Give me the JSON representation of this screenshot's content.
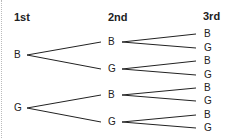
{
  "headers": [
    "1st",
    "2nd",
    "3rd"
  ],
  "tree": {
    "level1": [
      {
        "label": "B",
        "x": 14,
        "y": 55
      },
      {
        "label": "G",
        "x": 14,
        "y": 108
      }
    ],
    "level2": [
      {
        "label": "B",
        "x": 108,
        "y": 42
      },
      {
        "label": "G",
        "x": 108,
        "y": 69
      },
      {
        "label": "B",
        "x": 108,
        "y": 95
      },
      {
        "label": "G",
        "x": 108,
        "y": 122
      }
    ],
    "level3": [
      {
        "label": "B",
        "x": 204,
        "y": 34
      },
      {
        "label": "G",
        "x": 204,
        "y": 48
      },
      {
        "label": "B",
        "x": 204,
        "y": 61
      },
      {
        "label": "G",
        "x": 204,
        "y": 75
      },
      {
        "label": "B",
        "x": 204,
        "y": 88
      },
      {
        "label": "G",
        "x": 204,
        "y": 101
      },
      {
        "label": "B",
        "x": 204,
        "y": 115
      },
      {
        "label": "G",
        "x": 204,
        "y": 128
      }
    ]
  },
  "colors": {
    "line": "#222222",
    "text": "#222222"
  }
}
